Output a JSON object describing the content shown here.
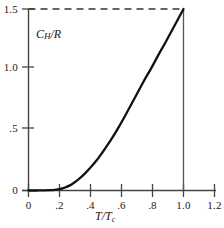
{
  "chart_data": {
    "type": "line",
    "title": "",
    "subtitle": "",
    "xlabel": "T/Tc",
    "ylabel": "CH/R",
    "xlim": [
      0,
      1.2
    ],
    "ylim": [
      0,
      1.5
    ],
    "grid": false,
    "legend": false,
    "x_ticks": [
      {
        "value": 0,
        "label": "0"
      },
      {
        "value": 0.2,
        "label": ".2"
      },
      {
        "value": 0.4,
        "label": ".4"
      },
      {
        "value": 0.6,
        "label": ".6"
      },
      {
        "value": 0.8,
        "label": ".8"
      },
      {
        "value": 1.0,
        "label": "1.0"
      },
      {
        "value": 1.2,
        "label": "1.2"
      }
    ],
    "y_ticks": [
      {
        "value": 0,
        "label": "0"
      },
      {
        "value": 0.5,
        "label": ".5"
      },
      {
        "value": 1.0,
        "label": "1.0"
      },
      {
        "value": 1.5,
        "label": "1.5"
      }
    ],
    "series": [
      {
        "name": "CH/R",
        "style": "solid",
        "color": "#111111",
        "x": [
          0.0,
          0.05,
          0.1,
          0.14,
          0.18,
          0.2,
          0.22,
          0.24,
          0.26,
          0.28,
          0.3,
          0.33,
          0.36,
          0.4,
          0.44,
          0.48,
          0.52,
          0.55,
          0.58,
          0.62,
          0.66,
          0.7,
          0.74,
          0.78,
          0.8,
          0.84,
          0.88,
          0.92,
          0.96,
          1.0
        ],
        "y": [
          0.0,
          0.0,
          0.001,
          0.003,
          0.008,
          0.012,
          0.018,
          0.027,
          0.038,
          0.052,
          0.07,
          0.1,
          0.135,
          0.19,
          0.25,
          0.32,
          0.395,
          0.455,
          0.52,
          0.61,
          0.705,
          0.8,
          0.895,
          0.985,
          1.03,
          1.125,
          1.215,
          1.31,
          1.405,
          1.5
        ]
      }
    ],
    "annotations": [
      {
        "name": "asymptote-dashed-line",
        "kind": "horizontal-dashed",
        "y": 1.5,
        "x_from": 0.0,
        "x_to": 1.0,
        "color": "#333333"
      },
      {
        "name": "transition-drop-line",
        "kind": "vertical-solid",
        "x": 1.0,
        "y_from": 0.0,
        "y_to": 1.5,
        "color": "#555555"
      }
    ]
  }
}
